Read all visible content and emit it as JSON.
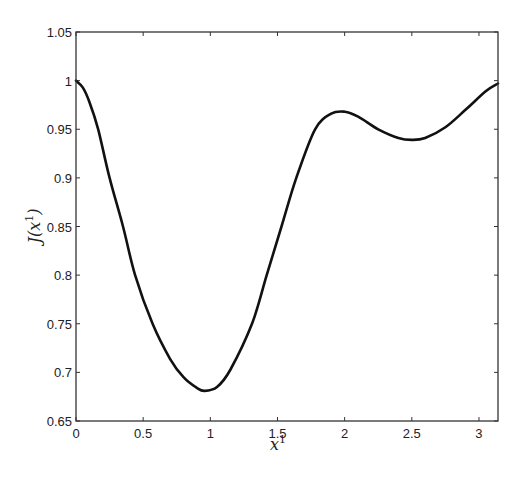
{
  "chart_data": {
    "type": "line",
    "title": "",
    "xlabel": "x^1",
    "ylabel": "J(x^1)",
    "xlim": [
      0,
      3.14159
    ],
    "ylim": [
      0.65,
      1.05
    ],
    "grid": false,
    "legend": null,
    "x_ticks": [
      0,
      0.5,
      1,
      1.5,
      2,
      2.5,
      3
    ],
    "x_tick_labels": [
      "0",
      "0.5",
      "1",
      "1.5",
      "2",
      "2.5",
      "3"
    ],
    "y_ticks": [
      0.65,
      0.7,
      0.75,
      0.8,
      0.85,
      0.9,
      0.95,
      1,
      1.05
    ],
    "y_tick_labels": [
      "0.65",
      "0.7",
      "0.75",
      "0.8",
      "0.85",
      "0.9",
      "0.95",
      "1",
      "1.05"
    ],
    "series": [
      {
        "name": "J(x1)",
        "color": "#111111",
        "x": [
          0,
          0.05,
          0.1,
          0.165,
          0.25,
          0.35,
          0.44,
          0.57,
          0.7,
          0.8,
          0.9,
          0.955,
          1.05,
          1.15,
          1.31,
          1.42,
          1.53,
          1.64,
          1.78,
          1.9,
          2.0,
          2.1,
          2.25,
          2.4,
          2.5,
          2.6,
          2.75,
          2.9,
          3.05,
          3.14159
        ],
        "y": [
          1.0,
          0.993,
          0.978,
          0.95,
          0.9,
          0.85,
          0.8,
          0.75,
          0.714,
          0.695,
          0.684,
          0.681,
          0.685,
          0.703,
          0.75,
          0.8,
          0.85,
          0.9,
          0.95,
          0.966,
          0.968,
          0.963,
          0.95,
          0.941,
          0.939,
          0.941,
          0.952,
          0.97,
          0.989,
          0.997
        ]
      }
    ],
    "annotations": [
      {
        "type": "min",
        "x": 0.955,
        "y": 0.681
      },
      {
        "type": "local_max",
        "x": 2.0,
        "y": 0.968
      },
      {
        "type": "local_min",
        "x": 2.5,
        "y": 0.939
      }
    ]
  }
}
